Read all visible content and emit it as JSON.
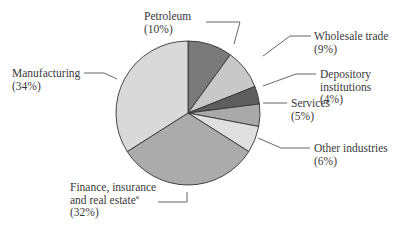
{
  "chart_data": {
    "type": "pie",
    "title": "",
    "start_angle_deg": 0,
    "direction": "clockwise",
    "slices": [
      {
        "label": "Petroleum",
        "pct_label": "(10%)",
        "value": 10,
        "color": "#7a7a7a"
      },
      {
        "label": "Wholesale trade",
        "pct_label": "(9%)",
        "value": 9,
        "color": "#c8c8c8"
      },
      {
        "label": "Depository institutions",
        "pct_label": "(4%)",
        "value": 4,
        "color": "#5e5e5e"
      },
      {
        "label": "Services",
        "pct_label": "(5%)",
        "value": 5,
        "color": "#a9a9a9"
      },
      {
        "label": "Other industries",
        "pct_label": "(6%)",
        "value": 6,
        "color": "#e0e0e0"
      },
      {
        "label": "Finance, insurance and real estateª",
        "pct_label": "(32%)",
        "value": 32,
        "color": "#ababab"
      },
      {
        "label": "Manufacturing",
        "pct_label": "(34%)",
        "value": 34,
        "color": "#d9d9d9"
      }
    ],
    "label_lines": {
      "Petroleum": [
        "Petroleum",
        "(10%)"
      ],
      "Wholesale trade": [
        "Wholesale trade",
        "(9%)"
      ],
      "Depository institutions": [
        "Depository",
        "institutions",
        "(4%)"
      ],
      "Services": [
        "Services",
        "(5%)"
      ],
      "Other industries": [
        "Other industries",
        "(6%)"
      ],
      "Finance, insurance and real estateª": [
        "Finance, insurance",
        "and real estateª",
        "(32%)"
      ],
      "Manufacturing": [
        "Manufacturing",
        "(34%)"
      ]
    }
  }
}
